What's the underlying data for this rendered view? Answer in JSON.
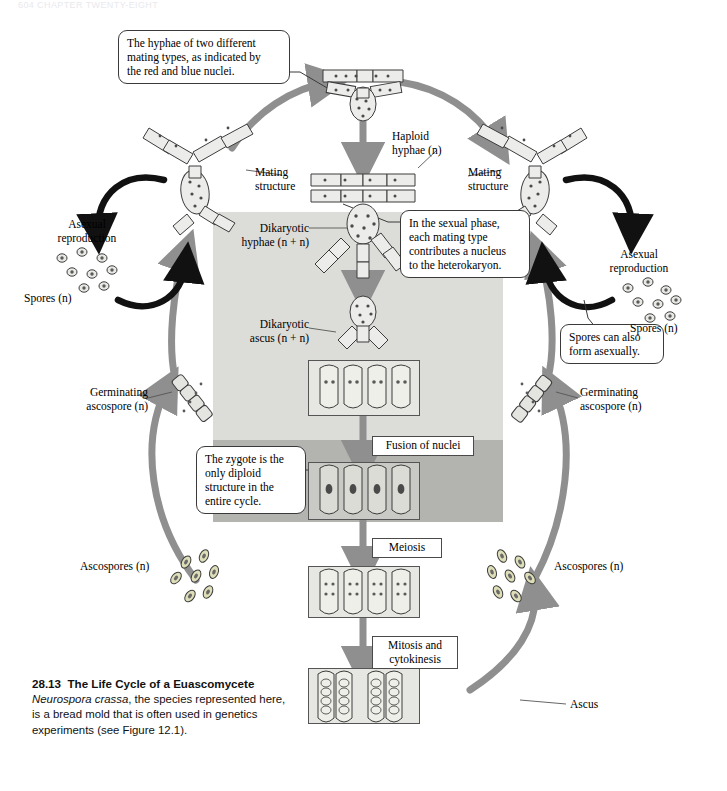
{
  "page": {
    "running_head": "604   CHAPTER TWENTY-EIGHT",
    "width": 727,
    "height": 791,
    "background": "#ffffff"
  },
  "figure": {
    "number": "28.13",
    "title": "The Life Cycle of a Euascomycete",
    "body_species": "Neurospora crassa",
    "body_rest": ", the species represented here,",
    "body_line2": "is a bread mold that is often used in genetics",
    "body_line3": "experiments (see Figure 12.1)."
  },
  "callouts": [
    {
      "id": "callout-mating-types",
      "text": "The hyphae of two different\nmating types, as indicated by\nthe red and blue nuclei."
    },
    {
      "id": "callout-sexual-phase",
      "text": "In the sexual phase,\neach mating type\ncontributes a nucleus\nto the heterokaryon."
    },
    {
      "id": "callout-zygote",
      "text": "The zygote is the\nonly diploid\nstructure in the\nentire cycle."
    },
    {
      "id": "callout-asexual-spores",
      "text": "Spores can also\nform asexually."
    }
  ],
  "labels": {
    "mating_structure_left": "Mating\nstructure",
    "mating_structure_right": "Mating\nstructure",
    "asexual_reproduction_left": "Asexual\nreproduction",
    "asexual_reproduction_right": "Asexual\nreproduction",
    "spores_left": "Spores (n)",
    "spores_right": "Spores (n)",
    "haploid_hyphae": "Haploid\nhyphae (n)",
    "dikaryotic_hyphae": "Dikaryotic\nhyphae (n + n)",
    "dikaryotic_ascus": "Dikaryotic\nascus (n + n)",
    "germinating_ascospore_left": "Germinating\nascospore (n)",
    "germinating_ascospore_right": "Germinating\nascospore (n)",
    "ascospores_left": "Ascospores (n)",
    "ascospores_right": "Ascospores (n)",
    "ascus": "Ascus"
  },
  "steps": [
    {
      "id": "step-fusion",
      "text": "Fusion of nuclei"
    },
    {
      "id": "step-meiosis",
      "text": "Meiosis"
    },
    {
      "id": "step-mitosis",
      "text": "Mitosis and\ncytokinesis"
    }
  ],
  "colors": {
    "panel_light": "#dcdcd8",
    "panel_dark": "#b3b3af",
    "arrow_gray": "#8f8f8f",
    "arrow_black": "#111111",
    "cell_fill": "#e6e6e2",
    "cell_fill_dark": "#c9c9c5",
    "outline": "#4a4a4a",
    "nucleus_red": "#8a2a2a",
    "nucleus_blue": "#2a3a8a"
  },
  "diagram": {
    "type": "life-cycle",
    "organism": "Neurospora crassa",
    "cycle_stages": [
      "Haploid hyphae (n)",
      "Mating structure",
      "Dikaryotic hyphae (n + n)",
      "Dikaryotic ascus (n + n)",
      "Fusion of nuclei",
      "Meiosis",
      "Mitosis and cytokinesis",
      "Ascus",
      "Ascospores (n)",
      "Germinating ascospore (n)"
    ],
    "asexual_branch": [
      "Asexual reproduction",
      "Spores (n)"
    ]
  }
}
